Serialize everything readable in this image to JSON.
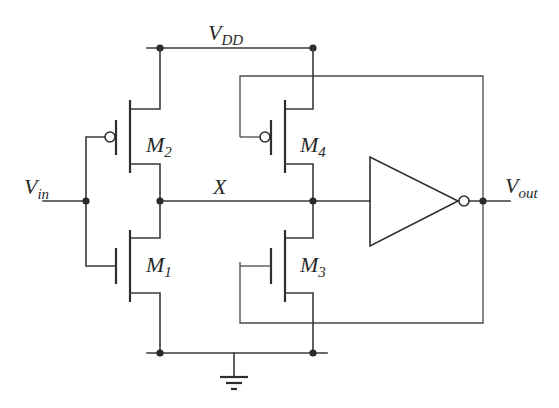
{
  "diagram": {
    "type": "circuit-schematic",
    "colors": {
      "line": "#3a3a3a",
      "background": "#ffffff"
    },
    "supply": {
      "main": "V",
      "sub": "DD"
    },
    "input": {
      "main": "V",
      "sub": "in"
    },
    "output": {
      "main": "V",
      "sub": "out"
    },
    "node_x": {
      "label": "X"
    },
    "transistors": [
      {
        "id": "M1",
        "main": "M",
        "sub": "1",
        "type": "NMOS",
        "gate": "Vin",
        "drain": "X",
        "source": "GND"
      },
      {
        "id": "M2",
        "main": "M",
        "sub": "2",
        "type": "PMOS",
        "gate": "Vin",
        "drain": "X",
        "source": "VDD"
      },
      {
        "id": "M3",
        "main": "M",
        "sub": "3",
        "type": "NMOS",
        "gate": "Vout",
        "drain": "X",
        "source": "GND"
      },
      {
        "id": "M4",
        "main": "M",
        "sub": "4",
        "type": "PMOS",
        "gate": "Vout",
        "drain": "X",
        "source": "VDD"
      }
    ],
    "inverter": {
      "input": "X",
      "output": "Vout",
      "icon": "inverter-icon"
    },
    "ground": {
      "icon": "ground-icon"
    }
  }
}
